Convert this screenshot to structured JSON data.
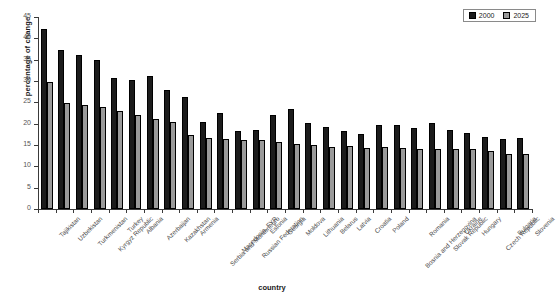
{
  "chart_data": {
    "type": "bar",
    "title": "",
    "xlabel": "country",
    "ylabel": "percentage of change",
    "ylim": [
      0,
      45
    ],
    "ytick_values": [
      0,
      5,
      10,
      15,
      20,
      25,
      30,
      35,
      40,
      45
    ],
    "grid": false,
    "legend_position": "top-right",
    "series_colors": {
      "2000": "#1c1c1c",
      "2025": "#9a9a9a"
    },
    "categories": [
      "Tajikistan",
      "Uzbekistan",
      "Turkmenistan",
      "Kyrgyz Republic",
      "Turkey",
      "Albania",
      "Azerbaijan",
      "Kazakhstan",
      "Armenia",
      "Serbia and Montenegro",
      "Macedonia, FYR",
      "Russian Federation",
      "Estonia",
      "Georgia",
      "Moldova",
      "Lithuania",
      "Belarus",
      "Latvia",
      "Croatia",
      "Poland",
      "Bosnia and Herzegovina",
      "Romania",
      "Slovak Republic",
      "Ukraine",
      "Hungary",
      "Czech Republic",
      "Bulgaria",
      "Slovenia"
    ],
    "series": [
      {
        "name": "2000",
        "values": [
          42.3,
          37.2,
          36.2,
          34.9,
          30.7,
          30.3,
          31.2,
          27.8,
          26.3,
          20.3,
          22.4,
          18.4,
          18.5,
          22.0,
          23.4,
          20.2,
          19.2,
          18.4,
          17.5,
          19.8,
          19.6,
          19.1,
          20.2,
          18.6,
          17.7,
          16.9,
          16.5,
          16.6
        ]
      },
      {
        "name": "2025",
        "values": [
          29.7,
          24.9,
          24.3,
          23.8,
          22.9,
          22.0,
          21.0,
          20.4,
          17.3,
          16.7,
          16.5,
          16.1,
          16.1,
          15.8,
          15.3,
          14.9,
          14.6,
          14.7,
          14.4,
          14.5,
          14.3,
          14.1,
          14.1,
          14.1,
          14.1,
          13.7,
          13.0,
          12.9
        ]
      }
    ]
  },
  "legend": {
    "items": [
      {
        "label": "2000",
        "color": "#1c1c1c"
      },
      {
        "label": "2025",
        "color": "#9a9a9a"
      }
    ]
  }
}
